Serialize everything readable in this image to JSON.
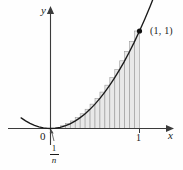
{
  "figure": {
    "kind": "riemann-sum-diagram",
    "axes": {
      "y_axis_label": "y",
      "x_axis_label": "x",
      "origin_label": "0",
      "x_tick_label": "1"
    },
    "annotations": {
      "point_label": "(1, 1)",
      "width_numerator": "1",
      "width_denominator": "n"
    },
    "colors": {
      "curve": "#1a1a1a",
      "axis": "#3b3b3b",
      "rect_fill": "#e8e8e8",
      "rect_stroke": "#9a9a9a",
      "point": "#111111",
      "text": "#1a1a1a"
    }
  },
  "chart_data": {
    "type": "area",
    "title": "",
    "subtitle": "",
    "xlabel": "x",
    "ylabel": "y",
    "xlim": [
      -0.35,
      1.28
    ],
    "ylim": [
      -0.08,
      1.18
    ],
    "grid": false,
    "legend": null,
    "annotations": [
      {
        "text": "(1, 1)",
        "x": 1.0,
        "y": 1.0
      },
      {
        "text": "1/n",
        "x": 0.055,
        "y": -0.22
      },
      {
        "text": "0",
        "x": -0.035,
        "y": -0.09
      },
      {
        "text": "1",
        "x": 1.0,
        "y": -0.09
      }
    ],
    "series": [
      {
        "name": "y = x^2",
        "type": "line",
        "x": [
          -0.33,
          -0.28,
          -0.23,
          -0.18,
          -0.13,
          -0.08,
          -0.03,
          0.0,
          0.06,
          0.11,
          0.17,
          0.22,
          0.28,
          0.33,
          0.39,
          0.44,
          0.5,
          0.56,
          0.61,
          0.67,
          0.72,
          0.78,
          0.83,
          0.89,
          0.94,
          1.0,
          1.06,
          1.12,
          1.18
        ],
        "values": [
          0.1089,
          0.0784,
          0.0529,
          0.0324,
          0.0169,
          0.0064,
          0.0009,
          0.0,
          0.0036,
          0.0121,
          0.0289,
          0.0484,
          0.0784,
          0.1089,
          0.1521,
          0.1936,
          0.25,
          0.3136,
          0.3721,
          0.4489,
          0.5184,
          0.6084,
          0.6889,
          0.7921,
          0.8836,
          1.0,
          1.1236,
          1.2544,
          1.3924
        ]
      },
      {
        "name": "circumscribed rectangles (right endpoints)",
        "type": "bar",
        "n": 18,
        "interval": [
          0,
          1
        ],
        "bar_width": 0.0555555,
        "right_endpoints": [
          0.0556,
          0.1111,
          0.1667,
          0.2222,
          0.2778,
          0.3333,
          0.3889,
          0.4444,
          0.5,
          0.5556,
          0.6111,
          0.6667,
          0.7222,
          0.7778,
          0.8333,
          0.8889,
          0.9444,
          1.0
        ],
        "values": [
          0.0031,
          0.0123,
          0.0278,
          0.0494,
          0.0772,
          0.1111,
          0.1512,
          0.1975,
          0.25,
          0.3086,
          0.3735,
          0.4444,
          0.5216,
          0.605,
          0.6944,
          0.7901,
          0.892,
          1.0
        ]
      }
    ]
  }
}
